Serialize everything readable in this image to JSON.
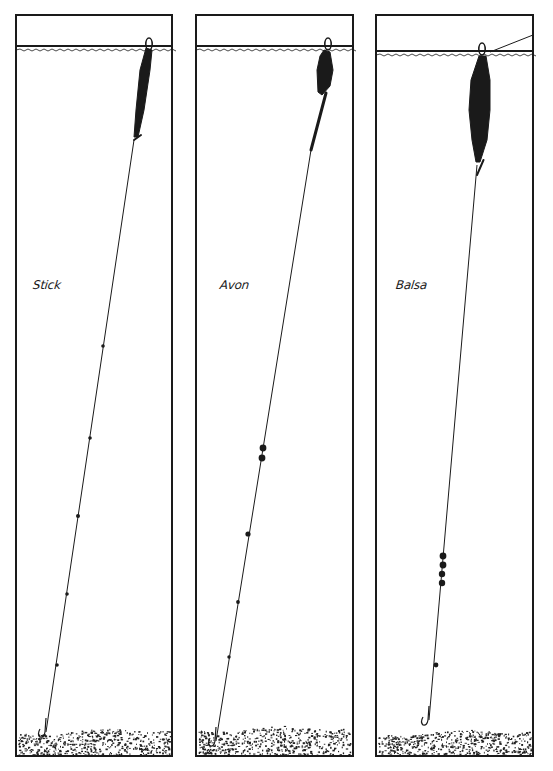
{
  "colors": {
    "ink": "#1a1a1a",
    "paper": "#ffffff",
    "gravel": "#222222"
  },
  "panels": [
    {
      "id": "stick",
      "label": "Stick",
      "box": {
        "x": 16,
        "y": 15,
        "w": 156,
        "h": 741
      },
      "label_pos": {
        "x": 33,
        "y": 285
      },
      "water_y": 46,
      "gravel_top": 733,
      "float": {
        "type": "stick",
        "eye": {
          "x": 149,
          "y": 42
        },
        "body": [
          [
            146,
            48
          ],
          [
            152,
            50
          ],
          [
            150,
            70
          ],
          [
            144,
            110
          ],
          [
            138,
            137
          ],
          [
            134,
            137
          ],
          [
            136,
            110
          ],
          [
            140,
            70
          ]
        ],
        "stem_to": {
          "x": 134,
          "y": 140
        }
      },
      "line": {
        "from": {
          "x": 134,
          "y": 140
        },
        "to": {
          "x": 46,
          "y": 732
        }
      },
      "shots": [
        {
          "x": 103,
          "y": 346,
          "r": 1.8
        },
        {
          "x": 90,
          "y": 438,
          "r": 1.8
        },
        {
          "x": 78,
          "y": 516,
          "r": 2.0
        },
        {
          "x": 67,
          "y": 594,
          "r": 1.8
        },
        {
          "x": 57,
          "y": 665,
          "r": 1.8
        }
      ],
      "hook": {
        "x": 46,
        "y": 732,
        "bend": 6
      }
    },
    {
      "id": "avon",
      "label": "Avon",
      "box": {
        "x": 196,
        "y": 15,
        "w": 157,
        "h": 741
      },
      "label_pos": {
        "x": 220,
        "y": 285
      },
      "water_y": 46,
      "gravel_top": 730,
      "float": {
        "type": "avon",
        "eye": {
          "x": 328,
          "y": 42
        },
        "body": [
          [
            324,
            50
          ],
          [
            330,
            52
          ],
          [
            333,
            70
          ],
          [
            330,
            86
          ],
          [
            322,
            95
          ],
          [
            318,
            92
          ],
          [
            317,
            70
          ],
          [
            320,
            56
          ]
        ],
        "stem_to": {
          "x": 311,
          "y": 150
        }
      },
      "line": {
        "from": {
          "x": 311,
          "y": 150
        },
        "to": {
          "x": 216,
          "y": 741
        }
      },
      "shots": [
        {
          "x": 263,
          "y": 448,
          "r": 3.4
        },
        {
          "x": 262,
          "y": 458,
          "r": 3.4
        },
        {
          "x": 248,
          "y": 534,
          "r": 2.6
        },
        {
          "x": 238,
          "y": 602,
          "r": 1.9
        },
        {
          "x": 229,
          "y": 657,
          "r": 1.7
        }
      ],
      "hook": {
        "x": 216,
        "y": 741,
        "bend": 6
      }
    },
    {
      "id": "balsa",
      "label": "Balsa",
      "box": {
        "x": 376,
        "y": 15,
        "w": 157,
        "h": 741
      },
      "label_pos": {
        "x": 396,
        "y": 285
      },
      "water_y": 51,
      "gravel_top": 734,
      "float": {
        "type": "balsa",
        "eye": {
          "x": 482,
          "y": 47
        },
        "body": [
          [
            479,
            56
          ],
          [
            486,
            56
          ],
          [
            490,
            80
          ],
          [
            490,
            110
          ],
          [
            487,
            140
          ],
          [
            480,
            162
          ],
          [
            476,
            162
          ],
          [
            472,
            140
          ],
          [
            469,
            110
          ],
          [
            471,
            80
          ]
        ],
        "stem_to": {
          "x": 477,
          "y": 175
        }
      },
      "drift_line": {
        "from": {
          "x": 490,
          "y": 52
        },
        "to": {
          "x": 533,
          "y": 35
        }
      },
      "line": {
        "from": {
          "x": 477,
          "y": 165
        },
        "to": {
          "x": 429,
          "y": 720
        }
      },
      "shots": [
        {
          "x": 443,
          "y": 556,
          "r": 3.4
        },
        {
          "x": 443,
          "y": 565,
          "r": 3.4
        },
        {
          "x": 442,
          "y": 574,
          "r": 3.2
        },
        {
          "x": 442,
          "y": 583,
          "r": 3.2
        },
        {
          "x": 436,
          "y": 665,
          "r": 2.4
        }
      ],
      "hook": {
        "x": 429,
        "y": 720,
        "bend": 6
      }
    }
  ]
}
